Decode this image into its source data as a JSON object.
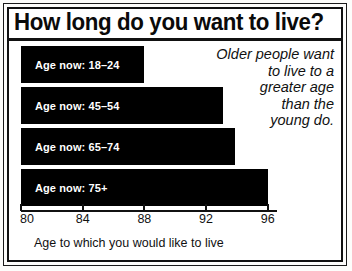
{
  "chart_data": {
    "type": "bar",
    "orientation": "horizontal",
    "title": "How long do you want to live?",
    "xlabel": "Age to which you would like to live",
    "ylabel": "",
    "categories": [
      "Age now: 18–24",
      "Age now: 45–54",
      "Age now: 65–74",
      "Age now: 75+"
    ],
    "values": [
      88.0,
      93.1,
      93.9,
      96.0
    ],
    "xlim": [
      80,
      96.6
    ],
    "xticks": [
      80,
      84,
      88,
      92,
      96
    ],
    "xtick_labels": [
      "80",
      "84",
      "88",
      "92",
      "96"
    ],
    "grid": false,
    "legend": false,
    "annotation": "Older people want to live to a greater age than the young do.",
    "annotation_lines": [
      "Older people want",
      "to live to a",
      "greater age",
      "than the",
      "young do."
    ],
    "bar_color": "#000000",
    "bar_label_color": "#ffffff",
    "background_color": "#ffffff",
    "frame_color": "#111111"
  },
  "bars": [
    {
      "label": "Age now: 18–24",
      "value": 88.0
    },
    {
      "label": "Age now: 45–54",
      "value": 93.1
    },
    {
      "label": "Age now: 65–74",
      "value": 93.9
    },
    {
      "label": "Age now: 75+",
      "value": 96.0
    }
  ],
  "axis": {
    "caption": "Age to which you would like to live",
    "ticks": [
      "80",
      "84",
      "88",
      "92",
      "96"
    ]
  },
  "annotation": {
    "line1": "Older people want",
    "line2": "to live to a",
    "line3": "greater age",
    "line4": "than the",
    "line5": "young do."
  },
  "header": {
    "title": "How long do you want to live?"
  }
}
